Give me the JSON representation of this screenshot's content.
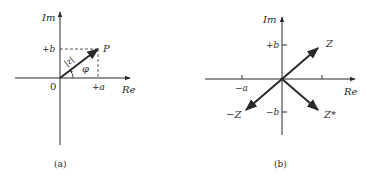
{
  "diagrams": [
    {
      "caption": "(a)",
      "axes": {
        "y_label": "Im",
        "x_label": "Re",
        "origin_label": "0"
      },
      "ticks": {
        "plus_b": "+b",
        "plus_a": "+a"
      },
      "point_label": "P",
      "magnitude_label": "|z|",
      "angle_label": "φ"
    },
    {
      "caption": "(b)",
      "axes": {
        "y_label": "Im",
        "x_label": "Re"
      },
      "ticks": {
        "plus_b": "+b",
        "minus_b": "−b",
        "plus_a": "+a",
        "minus_a": "−a"
      },
      "vectors": {
        "z": "Z",
        "neg_z": "−Z",
        "z_conj": "Z*"
      }
    }
  ],
  "colors": {
    "ink": "#2a2a2a",
    "background": "#ffffff"
  }
}
